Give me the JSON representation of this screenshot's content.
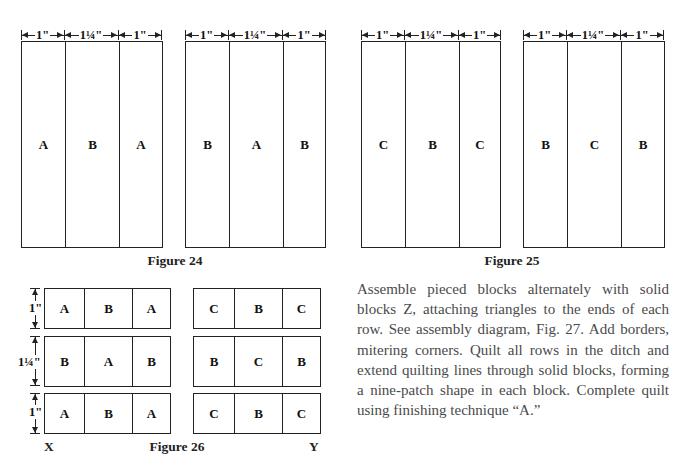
{
  "figure24": {
    "caption": "Figure 24",
    "dimensions": [
      "1\"",
      "1¼\"",
      "1\""
    ],
    "panels": [
      {
        "cells": [
          "A",
          "B",
          "A"
        ]
      },
      {
        "cells": [
          "B",
          "A",
          "B"
        ]
      }
    ]
  },
  "figure25": {
    "caption": "Figure 25",
    "dimensions": [
      "1\"",
      "1¼\"",
      "1\""
    ],
    "panels": [
      {
        "cells": [
          "C",
          "B",
          "C"
        ]
      },
      {
        "cells": [
          "B",
          "C",
          "B"
        ]
      }
    ]
  },
  "figure26": {
    "caption": "Figure 26",
    "row_heights": [
      "1\"",
      "1¼\"",
      "1\""
    ],
    "block_x": {
      "label": "X",
      "rows": [
        [
          "A",
          "B",
          "A"
        ],
        [
          "B",
          "A",
          "B"
        ],
        [
          "A",
          "B",
          "A"
        ]
      ]
    },
    "block_y": {
      "label": "Y",
      "rows": [
        [
          "C",
          "B",
          "C"
        ],
        [
          "B",
          "C",
          "B"
        ],
        [
          "C",
          "B",
          "C"
        ]
      ]
    }
  },
  "instructions": "Assemble pieced blocks alternately with solid blocks Z, attaching triangles to the ends of each row. See assembly diagram, Fig. 27. Add borders, mitering corners. Quilt all rows in the ditch and extend quilting lines through solid blocks, forming a nine-patch shape in each block. Complete quilt using finishing technique “A.”"
}
